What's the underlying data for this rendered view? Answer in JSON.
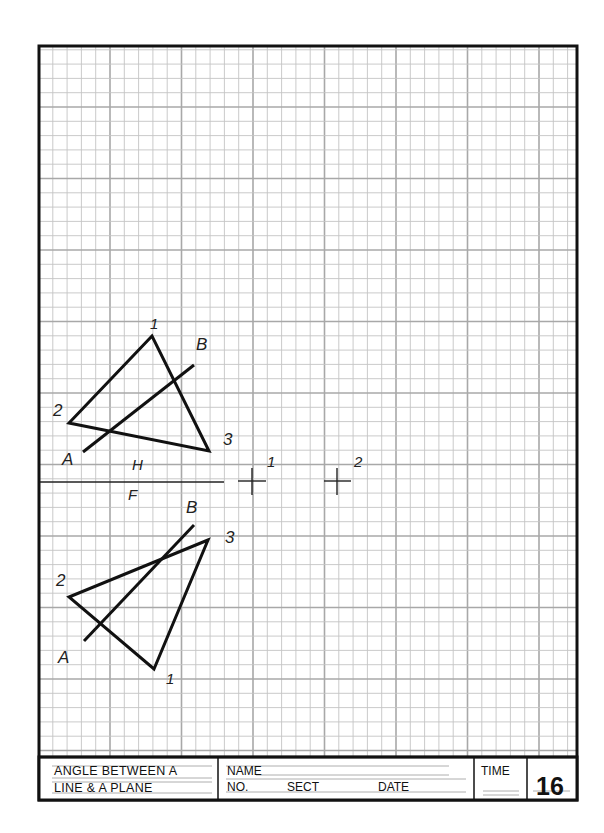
{
  "sheet": {
    "grid": {
      "x0": 39,
      "y0": 46,
      "x1": 577,
      "y1": 757,
      "step": 14.3,
      "major_every": 5,
      "major_x_start": 110,
      "major_y_start": 107,
      "minor_color": "#c4c4c4",
      "major_color": "#a8a8a8"
    },
    "border_color": "#111111"
  },
  "drawing": {
    "fold_line": {
      "label_top": "H",
      "label_bottom": "F"
    },
    "points": {
      "point1": {
        "label": "1"
      },
      "point2": {
        "label": "2"
      }
    },
    "top_view": {
      "vertices": [
        {
          "label": "1"
        },
        {
          "label": "2"
        },
        {
          "label": "3"
        }
      ],
      "line_labels": {
        "a": "A",
        "b": "B"
      }
    },
    "front_view": {
      "vertices": [
        {
          "label": "1"
        },
        {
          "label": "2"
        },
        {
          "label": "3"
        }
      ],
      "line_labels": {
        "a": "A",
        "b": "B"
      }
    }
  },
  "title_block": {
    "title_line1": "ANGLE BETWEEN A",
    "title_line2": "LINE & A PLANE",
    "name_label": "NAME",
    "no_label": "NO.",
    "sect_label": "SECT",
    "date_label": "DATE",
    "time_label": "TIME",
    "sheet_number": "16"
  }
}
